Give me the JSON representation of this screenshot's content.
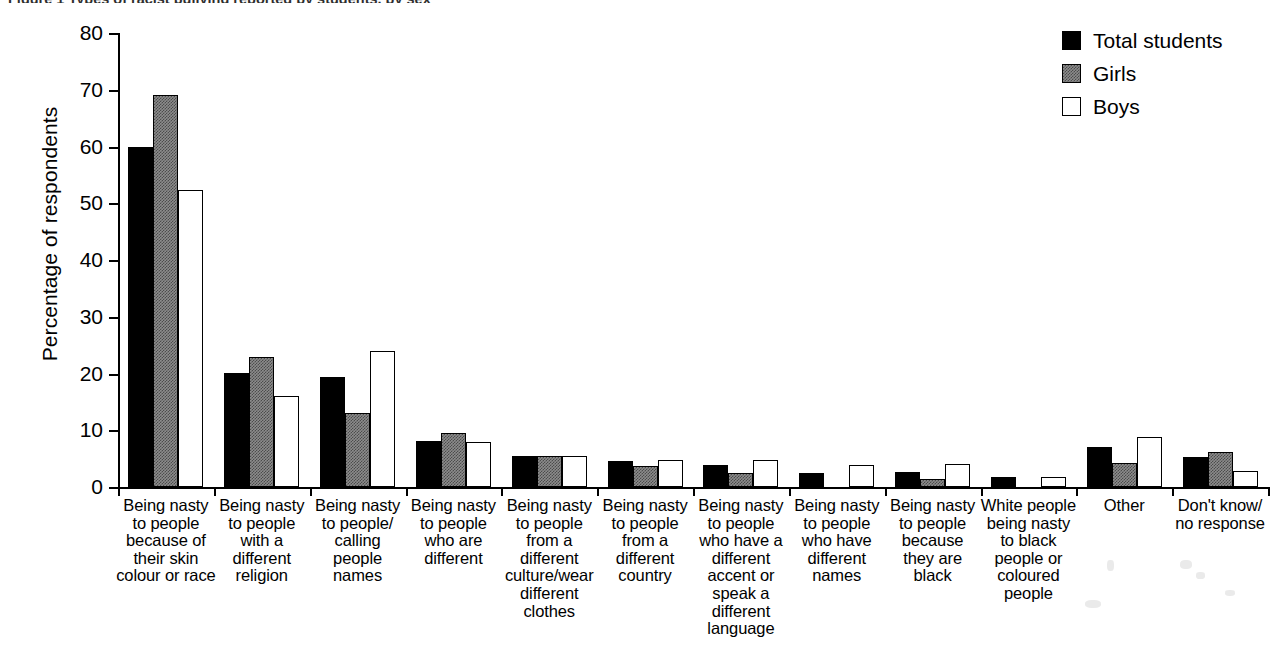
{
  "figure": {
    "title_cropped": "Figure 1  Types of racist bullying reported by students, by sex"
  },
  "legend": {
    "position": "top-right",
    "entries": [
      {
        "label": "Total students",
        "swatch": "total",
        "color": "#000000"
      },
      {
        "label": "Girls",
        "swatch": "girls",
        "color": "#8c8c8c"
      },
      {
        "label": "Boys",
        "swatch": "boys",
        "color": "#ffffff"
      }
    ]
  },
  "axes": {
    "y_title": "Percentage of respondents",
    "y_ticks": [
      "0",
      "10",
      "20",
      "30",
      "40",
      "50",
      "60",
      "70",
      "80"
    ],
    "x_title": ""
  },
  "chart_data": {
    "type": "bar",
    "title": "Figure 1  Types of racist bullying reported by students, by sex",
    "xlabel": "",
    "ylabel": "Percentage of respondents",
    "ylim": [
      0,
      80
    ],
    "ytick_step": 10,
    "grid": false,
    "legend_position": "top-right",
    "categories": [
      "Being nasty to people because of their skin colour or race",
      "Being nasty to people with a different religion",
      "Being nasty to people/ calling people names",
      "Being nasty to people who are different",
      "Being nasty to people from a different culture/wear different clothes",
      "Being nasty to people from a different country",
      "Being nasty to people who have a different accent or speak a different language",
      "Being nasty to people who have different names",
      "Being nasty to people because they are black",
      "White people being nasty to black people or coloured people",
      "Other",
      "Don't know/ no response"
    ],
    "series": [
      {
        "name": "Total students",
        "values": [
          60.0,
          20.1,
          19.3,
          8.1,
          5.5,
          4.6,
          3.8,
          2.5,
          2.6,
          1.7,
          7.0,
          5.3
        ]
      },
      {
        "name": "Girls",
        "values": [
          69.1,
          22.9,
          13.0,
          9.5,
          5.4,
          3.7,
          2.4,
          0.0,
          1.5,
          0.0,
          4.2,
          6.2
        ]
      },
      {
        "name": "Boys",
        "values": [
          52.4,
          16.0,
          24.0,
          8.0,
          5.5,
          4.8,
          4.8,
          3.9,
          4.0,
          1.8,
          8.9,
          2.9
        ]
      }
    ]
  },
  "category_label_lines": [
    [
      "Being nasty",
      "to people",
      "because of",
      "their skin",
      "colour or race"
    ],
    [
      "Being nasty",
      "to people",
      "with a",
      "different",
      "religion"
    ],
    [
      "Being nasty",
      "to people/",
      "calling",
      "people",
      "names"
    ],
    [
      "Being nasty",
      "to people",
      "who are",
      "different"
    ],
    [
      "Being nasty",
      "to people",
      "from a",
      "different",
      "culture/wear",
      "different",
      "clothes"
    ],
    [
      "Being nasty",
      "to people",
      "from a",
      "different",
      "country"
    ],
    [
      "Being nasty",
      "to people",
      "who have a",
      "different",
      "accent or",
      "speak a",
      "different",
      "language"
    ],
    [
      "Being nasty",
      "to people",
      "who have",
      "different",
      "names"
    ],
    [
      "Being nasty",
      "to people",
      "because",
      "they are",
      "black"
    ],
    [
      "White people",
      "being nasty",
      "to black",
      "people or",
      "coloured",
      "people"
    ],
    [
      "Other"
    ],
    [
      "Don't know/",
      "no response"
    ]
  ]
}
